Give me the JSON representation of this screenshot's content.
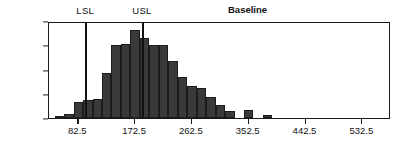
{
  "chart_data": {
    "type": "bar",
    "title": "Baseline",
    "xlabel": "",
    "ylabel": "",
    "ylim": [
      0,
      400
    ],
    "xlim": [
      36,
      578
    ],
    "grid": false,
    "legend": null,
    "y_ticks": [
      0,
      100,
      200,
      300,
      400
    ],
    "y_tick_labels": [
      "0",
      "100",
      "200",
      "300",
      "400"
    ],
    "x_ticks": [
      82.5,
      172.5,
      262.5,
      352.5,
      442.5,
      532.5
    ],
    "x_tick_labels": [
      "82.5",
      "172.5",
      "262.5",
      "352.5",
      "442.5",
      "532.5"
    ],
    "bin_width": 15,
    "bin_centers": [
      52.5,
      67.5,
      82.5,
      97.5,
      112.5,
      127.5,
      142.5,
      157.5,
      172.5,
      187.5,
      202.5,
      217.5,
      232.5,
      247.5,
      262.5,
      277.5,
      292.5,
      307.5,
      322.5,
      352.5,
      382.5
    ],
    "categories": [
      "52.5",
      "67.5",
      "82.5",
      "97.5",
      "112.5",
      "127.5",
      "142.5",
      "157.5",
      "172.5",
      "187.5",
      "202.5",
      "217.5",
      "232.5",
      "247.5",
      "262.5",
      "277.5",
      "292.5",
      "307.5",
      "322.5",
      "352.5",
      "382.5"
    ],
    "values": [
      5,
      18,
      65,
      75,
      80,
      185,
      300,
      305,
      365,
      330,
      300,
      300,
      235,
      170,
      130,
      125,
      85,
      55,
      30,
      35,
      12
    ],
    "bar_color": "#3a3a3a",
    "annotations": [
      {
        "name": "LSL",
        "label": "LSL",
        "x": 95,
        "type": "vline"
      },
      {
        "name": "USL",
        "label": "USL",
        "x": 185,
        "type": "vline"
      }
    ]
  },
  "axes": {
    "y_labels": [
      "400",
      "300",
      "200",
      "100",
      "0"
    ],
    "x_labels": [
      "82.5",
      "172.5",
      "262.5",
      "352.5",
      "442.5",
      "532.5"
    ]
  },
  "spec_limits": {
    "lower_label": "LSL",
    "upper_label": "USL"
  },
  "title": "Baseline"
}
